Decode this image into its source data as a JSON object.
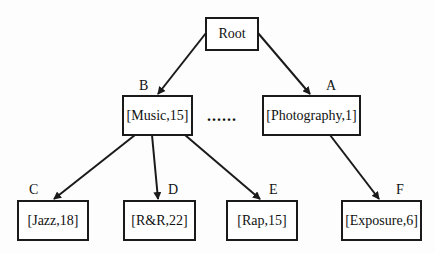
{
  "diagram": {
    "type": "tree",
    "nodes": {
      "root": {
        "label": "Root"
      },
      "b": {
        "letter": "B",
        "label": "[Music,15]"
      },
      "a": {
        "letter": "A",
        "label": "[Photography,1]"
      },
      "c": {
        "letter": "C",
        "label": "[Jazz,18]"
      },
      "d": {
        "letter": "D",
        "label": "[R&R,22]"
      },
      "e": {
        "letter": "E",
        "label": "[Rap,15]"
      },
      "f": {
        "letter": "F",
        "label": "[Exposure,6]"
      }
    },
    "ellipsis": "......",
    "edges": [
      {
        "from": "Root",
        "to": "B"
      },
      {
        "from": "Root",
        "to": "A"
      },
      {
        "from": "B",
        "to": "C"
      },
      {
        "from": "B",
        "to": "D"
      },
      {
        "from": "B",
        "to": "E"
      },
      {
        "from": "A",
        "to": "F"
      }
    ]
  }
}
